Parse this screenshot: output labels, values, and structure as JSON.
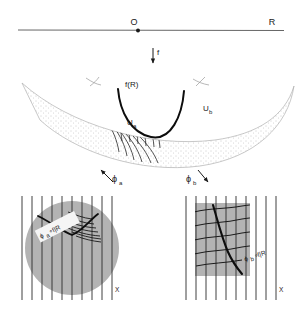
{
  "figure": {
    "domain_line": {
      "label_R": "R",
      "label_O": "O"
    },
    "map_arrow": {
      "label_f": "f"
    },
    "surface": {
      "label_fR": "f(R)",
      "label_Ua": "U",
      "label_Ua_sub": "a",
      "label_Ub": "U",
      "label_Ub_sub": "b"
    },
    "chart_arrows": {
      "left_label": "ϕ",
      "left_sub": "a",
      "right_label": "ϕ",
      "right_sub": "b"
    },
    "left_chart": {
      "curve_label": "ϕ",
      "curve_sub": "a",
      "curve_rest": "∘f|R",
      "axis_label": "X"
    },
    "right_chart": {
      "curve_label": "ϕ",
      "curve_sub": "b",
      "curve_rest": "∘f|R",
      "axis_label": "X"
    },
    "colors": {
      "ink": "#1a1a1a",
      "gray_fill": "#b3b3b3",
      "stipple": "#9a9a9a",
      "thin_line": "#555555"
    }
  }
}
